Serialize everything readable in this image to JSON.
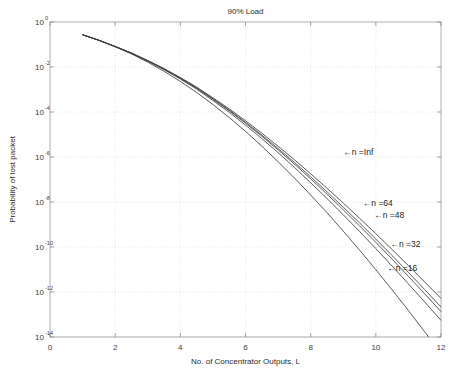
{
  "chart_data": {
    "type": "line",
    "title": "90% Load",
    "xlabel": "No. of Concentrator Outputs, L",
    "ylabel": "Probability of lost packet",
    "xlim": [
      0,
      12
    ],
    "ylim": [
      1e-14,
      1
    ],
    "yscale": "log",
    "xscale": "linear",
    "grid": true,
    "legend": "inline-annotations",
    "xticks": [
      "0",
      "2",
      "4",
      "6",
      "8",
      "10",
      "12"
    ],
    "xtick_values": [
      0,
      2,
      4,
      6,
      8,
      10,
      12
    ],
    "ytick_labels": [
      "10^0",
      "10^-2",
      "10^-4",
      "10^-6",
      "10^-8",
      "10^-10",
      "10^-12",
      "10^-14"
    ],
    "ytick_mantissa": [
      "10",
      "10",
      "10",
      "10",
      "10",
      "10",
      "10",
      "10"
    ],
    "ytick_exponents": [
      "0",
      "-2",
      "-4",
      "-6",
      "-8",
      "-10",
      "-12",
      "-14"
    ],
    "ytick_values": [
      1,
      0.01,
      0.0001,
      1e-06,
      1e-08,
      1e-10,
      1e-12,
      1e-14
    ],
    "x": [
      1,
      1.5,
      2,
      2.5,
      3,
      3.5,
      4,
      4.5,
      5,
      5.5,
      6,
      6.5,
      7,
      7.5,
      8,
      8.5,
      9,
      9.5,
      10,
      10.5,
      11,
      11.5,
      12
    ],
    "series": [
      {
        "name": "n =Inf",
        "label": "←n =Inf",
        "color": "#3d3d3d",
        "annotation_x": 9.0,
        "annotation_y": 1.7e-06,
        "values": [
          0.27,
          0.155,
          0.082,
          0.042,
          0.0195,
          0.0085,
          0.0034,
          0.00128,
          0.00043,
          0.000138,
          4.1e-05,
          1.15e-05,
          3e-06,
          7.6e-07,
          1.8e-07,
          4.1e-08,
          9e-09,
          1.9e-09,
          3.9e-10,
          7.7e-11,
          1.5e-11,
          2.8e-12,
          5.2e-13
        ]
      },
      {
        "name": "n =64",
        "label": "←n =64",
        "color": "#3d3d3d",
        "annotation_x": 9.6,
        "annotation_y": 9.5e-09,
        "values": [
          0.27,
          0.155,
          0.0818,
          0.0415,
          0.019,
          0.0082,
          0.00322,
          0.00119,
          0.00039,
          0.000122,
          3.5e-05,
          9.5e-06,
          2.4e-06,
          5.8e-07,
          1.32e-07,
          2.85e-08,
          5.9e-09,
          1.18e-09,
          2.25e-10,
          4.15e-11,
          7.4e-12,
          1.28e-12,
          2.15e-13
        ]
      },
      {
        "name": "n =48",
        "label": "←n =48",
        "color": "#3d3d3d",
        "annotation_x": 9.95,
        "annotation_y": 2.6e-09,
        "values": [
          0.27,
          0.1548,
          0.0815,
          0.0412,
          0.0187,
          0.008,
          0.00312,
          0.00114,
          0.000366,
          0.000113,
          3.18e-05,
          8.4e-06,
          2.07e-06,
          4.85e-07,
          1.07e-07,
          2.25e-08,
          4.5e-09,
          8.7e-10,
          1.61e-10,
          2.87e-11,
          4.95e-12,
          8.3e-13,
          1.35e-13
        ]
      },
      {
        "name": "n =32",
        "label": "←n =32",
        "color": "#3d3d3d",
        "annotation_x": 10.45,
        "annotation_y": 1.35e-10,
        "values": [
          0.27,
          0.1545,
          0.081,
          0.0407,
          0.0182,
          0.00765,
          0.00292,
          0.00104,
          0.000324,
          9.7e-05,
          2.62e-05,
          6.6e-06,
          1.56e-06,
          3.45e-07,
          7.2e-08,
          1.43e-08,
          2.7e-09,
          4.9e-10,
          8.5e-11,
          1.42e-11,
          2.3e-12,
          3.6e-13,
          5.5e-14
        ]
      },
      {
        "name": "n =16",
        "label": "←n =16",
        "color": "#3d3d3d",
        "annotation_x": 10.35,
        "annotation_y": 1.15e-11,
        "values": [
          0.27,
          0.152,
          0.0785,
          0.0383,
          0.0164,
          0.00645,
          0.00228,
          0.00074,
          0.000215,
          5.7e-05,
          1.38e-05,
          3.05e-06,
          6.2e-07,
          1.17e-07,
          2.05e-08,
          3.35e-09,
          5.1e-10,
          7.3e-11,
          9.8e-12,
          1.25e-12,
          1.5e-13,
          1.7e-14,
          1.9e-15
        ]
      }
    ]
  }
}
